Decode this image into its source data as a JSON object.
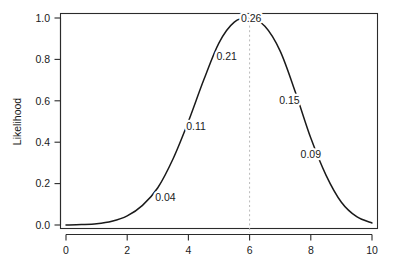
{
  "chart_data": {
    "type": "line",
    "title": "",
    "subtitle": "",
    "xlabel": "",
    "ylabel": "Likelihood",
    "xlim": [
      0,
      10
    ],
    "ylim": [
      0.0,
      1.0
    ],
    "grid": false,
    "legend": null,
    "legend_position": "none",
    "x_ticks": [
      "0",
      "2",
      "4",
      "6",
      "8",
      "10"
    ],
    "x_tick_values": [
      0,
      2,
      4,
      6,
      8,
      10
    ],
    "y_ticks": [
      "0.0",
      "0.2",
      "0.4",
      "0.6",
      "0.8",
      "1.0"
    ],
    "y_tick_values": [
      0.0,
      0.2,
      0.4,
      0.6,
      0.8,
      1.0
    ],
    "series": [
      {
        "name": "likelihood",
        "color": "#1a1a1a",
        "x": [
          0.0,
          0.5,
          1.0,
          1.5,
          2.0,
          2.5,
          3.0,
          3.5,
          4.0,
          4.5,
          5.0,
          5.5,
          6.0,
          6.5,
          7.0,
          7.5,
          8.0,
          8.5,
          9.0,
          9.5,
          10.0
        ],
        "values": [
          0.0,
          0.002,
          0.006,
          0.018,
          0.044,
          0.095,
          0.18,
          0.32,
          0.5,
          0.7,
          0.88,
          0.98,
          1.0,
          0.96,
          0.84,
          0.64,
          0.42,
          0.24,
          0.11,
          0.04,
          0.01
        ]
      }
    ],
    "annotations": [
      {
        "text": "0.04",
        "x": 3.0,
        "y": 0.18,
        "label_x": 3.25,
        "label_y": 0.135
      },
      {
        "text": "0.11",
        "x": 4.05,
        "y": 0.52,
        "label_x": 4.25,
        "label_y": 0.48
      },
      {
        "text": "0.21",
        "x": 5.05,
        "y": 0.86,
        "label_x": 5.25,
        "label_y": 0.815
      },
      {
        "text": "0.26",
        "x": 6.0,
        "y": 1.0,
        "label_x": 6.05,
        "label_y": 1.0
      },
      {
        "text": "0.15",
        "x": 7.45,
        "y": 0.65,
        "label_x": 7.3,
        "label_y": 0.605
      },
      {
        "text": "0.09",
        "x": 8.15,
        "y": 0.39,
        "label_x": 8.0,
        "label_y": 0.345
      }
    ],
    "reference_lines": [
      {
        "orientation": "vertical",
        "value": 6,
        "style": "dashed",
        "color": "#b9b9b9"
      }
    ]
  },
  "axes": {
    "y_axis_title": "Likelihood"
  }
}
